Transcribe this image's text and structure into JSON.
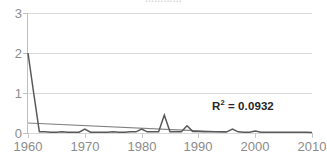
{
  "chart_data": {
    "type": "line",
    "title": "",
    "title_remnant": "…………",
    "xlabel": "",
    "ylabel": "",
    "xlim": [
      1960,
      2010
    ],
    "ylim": [
      0,
      3
    ],
    "xticks": [
      1960,
      1970,
      1980,
      1990,
      2000,
      2010
    ],
    "xtick_labels": [
      "1960",
      "1970",
      "1980",
      "1990",
      "2000",
      "2010"
    ],
    "yticks": [
      0,
      1,
      2,
      3
    ],
    "ytick_labels": [
      "0",
      "1",
      "2",
      "3"
    ],
    "grid": "horizontal",
    "legend": "none",
    "series": [
      {
        "name": "data",
        "color": "#595959",
        "x": [
          1960,
          1961,
          1962,
          1963,
          1964,
          1965,
          1966,
          1967,
          1968,
          1969,
          1970,
          1971,
          1972,
          1973,
          1974,
          1975,
          1976,
          1977,
          1978,
          1979,
          1980,
          1981,
          1982,
          1983,
          1984,
          1985,
          1986,
          1987,
          1988,
          1989,
          1990,
          1991,
          1992,
          1993,
          1994,
          1995,
          1996,
          1997,
          1998,
          1999,
          2000,
          2001,
          2002,
          2003,
          2004,
          2005,
          2006,
          2007,
          2008,
          2009,
          2010
        ],
        "values": [
          2.0,
          1.0,
          0.03,
          0.03,
          0.02,
          0.02,
          0.03,
          0.02,
          0.02,
          0.02,
          0.1,
          0.02,
          0.02,
          0.02,
          0.02,
          0.03,
          0.02,
          0.02,
          0.03,
          0.03,
          0.1,
          0.03,
          0.03,
          0.03,
          0.45,
          0.03,
          0.03,
          0.03,
          0.18,
          0.04,
          0.04,
          0.03,
          0.03,
          0.03,
          0.03,
          0.03,
          0.1,
          0.03,
          0.02,
          0.02,
          0.05,
          0.02,
          0.02,
          0.02,
          0.02,
          0.02,
          0.02,
          0.02,
          0.02,
          0.02,
          0.01
        ]
      },
      {
        "name": "trendline",
        "color": "#808080",
        "x": [
          1960,
          1995
        ],
        "values": [
          0.25,
          0.02
        ]
      }
    ],
    "annotations": [
      {
        "name": "r-squared",
        "text_prefix": "R",
        "text_sup": "2",
        "text_suffix": " = 0.0932",
        "value": 0.0932
      }
    ],
    "colors": {
      "series": "#595959",
      "trendline": "#808080",
      "gridline": "#d9d9d9",
      "axis": "#bfbfbf",
      "tick_label": "#8c8c8c",
      "annotation": "#262626",
      "background": "#ffffff"
    }
  },
  "annotation_text": {
    "r2_prefix": "R",
    "r2_sup": "2",
    "r2_suffix": " = 0.0932"
  }
}
